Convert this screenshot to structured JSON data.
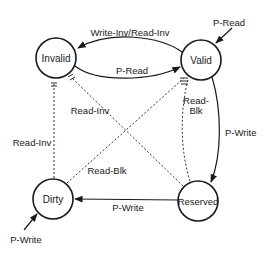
{
  "diagram": {
    "type": "state-transition",
    "states": [
      {
        "id": "invalid",
        "label": "Invalid",
        "cx": 56,
        "cy": 58
      },
      {
        "id": "valid",
        "label": "Valid",
        "cx": 201,
        "cy": 60
      },
      {
        "id": "dirty",
        "label": "Dirty",
        "cx": 53,
        "cy": 199
      },
      {
        "id": "reserved",
        "label": "Reserved",
        "cx": 198,
        "cy": 201
      }
    ],
    "transitions": [
      {
        "from": "valid",
        "to": "invalid",
        "label": "Write-Inv/Read-Inv",
        "style": "solid"
      },
      {
        "from": "invalid",
        "to": "valid",
        "label": "P-Read",
        "style": "solid"
      },
      {
        "from": "external",
        "to": "valid",
        "label": "P-Read",
        "style": "solid"
      },
      {
        "from": "valid",
        "to": "reserved",
        "label": "P-Write",
        "style": "solid"
      },
      {
        "from": "reserved",
        "to": "dirty",
        "label": "P-Write",
        "style": "solid"
      },
      {
        "from": "external",
        "to": "dirty",
        "label": "P-Write",
        "style": "solid"
      },
      {
        "from": "dirty",
        "to": "invalid",
        "label": "Read-Inv",
        "style": "dotted"
      },
      {
        "from": "reserved",
        "to": "invalid",
        "label": "Read-Inv",
        "style": "dotted"
      },
      {
        "from": "dirty",
        "to": "valid",
        "label": "Read-Blk",
        "style": "dotted"
      },
      {
        "from": "reserved",
        "to": "valid",
        "label": "Read-Blk",
        "style": "dotted"
      }
    ],
    "labels": {
      "write_inv_read_inv": "Write-Inv/Read-Inv",
      "p_read_mid": "P-Read",
      "p_read_ext": "P-Read",
      "p_write_right": "P-Write",
      "p_write_bottom": "P-Write",
      "p_write_ext": "P-Write",
      "read_inv_left": "Read-Inv",
      "read_inv_diag": "Read-Inv",
      "read_blk_diag": "Read-Blk",
      "read_blk_right_1": "Read-",
      "read_blk_right_2": "Blk"
    },
    "colors": {
      "stroke": "#1a1a1a",
      "background": "#ffffff"
    }
  }
}
